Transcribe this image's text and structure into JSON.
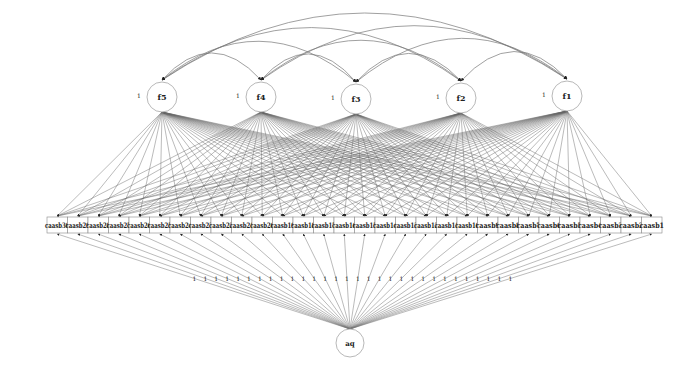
{
  "diagram": {
    "type": "structural-equation-model",
    "factors": [
      {
        "id": "f5",
        "label": "f5",
        "variance_label": "1",
        "cx": 162,
        "cy": 97
      },
      {
        "id": "f4",
        "label": "f4",
        "variance_label": "1",
        "cx": 261,
        "cy": 97
      },
      {
        "id": "f3",
        "label": "f3",
        "variance_label": "1",
        "cx": 356,
        "cy": 99
      },
      {
        "id": "f2",
        "label": "f2",
        "variance_label": "1",
        "cx": 461,
        "cy": 98
      },
      {
        "id": "f1",
        "label": "f1",
        "variance_label": "1",
        "cx": 567,
        "cy": 96
      }
    ],
    "indicators": [
      "caasb30",
      "caasb29",
      "caasb28",
      "caasb27",
      "caasb26",
      "caasb25",
      "caasb24",
      "caasb23",
      "caasb22",
      "caasb21",
      "caasb20",
      "caasb19",
      "caasb18",
      "caasb17",
      "caasb16",
      "caasb15",
      "caasb14",
      "caasb13",
      "caasb12",
      "caasb11",
      "caasb10",
      "caasb9",
      "caasb8",
      "caasb7",
      "caasb6",
      "caasb5",
      "caasb4",
      "caasb3",
      "caasb2",
      "caasb1"
    ],
    "method_factor": {
      "id": "aq",
      "label": "aq",
      "cx": 350,
      "cy": 343
    },
    "method_loading_label": "1",
    "covariances": [
      [
        "f5",
        "f4"
      ],
      [
        "f5",
        "f3"
      ],
      [
        "f5",
        "f2"
      ],
      [
        "f5",
        "f1"
      ],
      [
        "f4",
        "f3"
      ],
      [
        "f4",
        "f2"
      ],
      [
        "f4",
        "f1"
      ],
      [
        "f3",
        "f2"
      ],
      [
        "f3",
        "f1"
      ],
      [
        "f2",
        "f1"
      ]
    ],
    "colors": {
      "line": "#555555",
      "node_stroke": "#888888",
      "arrow": "#222222",
      "text": "#222222"
    }
  }
}
